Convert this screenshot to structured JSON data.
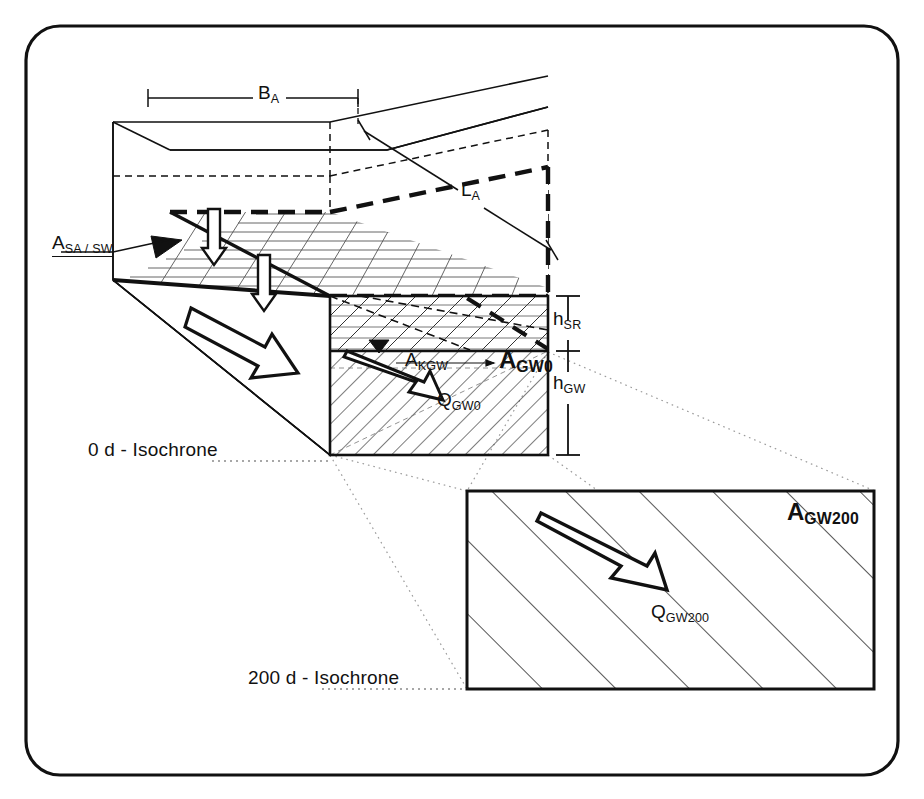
{
  "figure": {
    "title_present": false,
    "kind": "hydrogeology-block-diagram",
    "colors": {
      "line": "#111111",
      "hatch": "#222222",
      "dotted": "#8a8a8a",
      "background": "#ffffff"
    }
  },
  "labels": {
    "width_dimension": {
      "base": "B",
      "sub": "A"
    },
    "length_dimension": {
      "base": "L",
      "sub": "A"
    },
    "surface_area": {
      "base": "A",
      "sub": "SA / SW"
    },
    "capillary_area": {
      "base": "A",
      "sub": "KGW"
    },
    "gw_area_0": {
      "base": "A",
      "sub": "GW0"
    },
    "gw_flow_0": {
      "base": "Q",
      "sub": "GW0"
    },
    "height_unsaturated": {
      "base": "h",
      "sub": "SR"
    },
    "height_groundwater": {
      "base": "h",
      "sub": "GW"
    },
    "isochrone_0": "0 d - Isochrone",
    "isochrone_200": "200 d - Isochrone",
    "gw_area_200": {
      "base": "A",
      "sub": "GW200"
    },
    "gw_flow_200": {
      "base": "Q",
      "sub": "GW200"
    }
  },
  "geometry": {
    "outer_frame": {
      "x": 26,
      "y": 26,
      "w": 872,
      "h": 749,
      "radius": 34
    },
    "inset_box": {
      "x": 466,
      "y": 490,
      "w": 409,
      "h": 200
    },
    "front_face": {
      "x": 330,
      "y": 296,
      "w": 218,
      "h": 159
    },
    "water_table_y": 351
  }
}
